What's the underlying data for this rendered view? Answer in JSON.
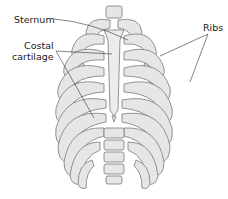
{
  "diagram": {
    "labels": {
      "sternum": "Sternum",
      "costal_line1": "Costal",
      "costal_line2": "cartilage",
      "ribs": "Ribs"
    },
    "colors": {
      "bone_fill": "#e6e6e6",
      "bone_stroke": "#7a7a7a",
      "text": "#222222",
      "leader_line": "#333333"
    }
  }
}
